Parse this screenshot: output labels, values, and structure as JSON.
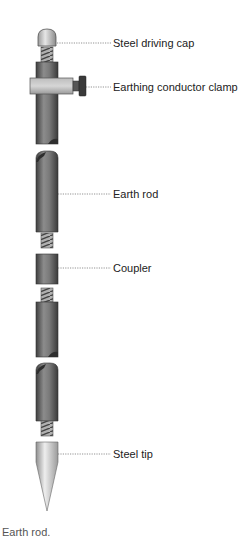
{
  "diagram": {
    "labels": [
      {
        "id": "cap",
        "text": "Steel driving cap",
        "y": 43
      },
      {
        "id": "clamp",
        "text": "Earthing conductor clamp",
        "y": 87
      },
      {
        "id": "rod",
        "text": "Earth rod",
        "y": 194
      },
      {
        "id": "coupler",
        "text": "Coupler",
        "y": 268
      },
      {
        "id": "tip",
        "text": "Steel tip",
        "y": 454
      }
    ],
    "caption": "Earth rod."
  },
  "colors": {
    "rod_dark": "#4a4a4a",
    "rod_mid": "#8a8a8a",
    "rod_light": "#c8c8c8",
    "leader": "#666666",
    "text": "#222222"
  }
}
